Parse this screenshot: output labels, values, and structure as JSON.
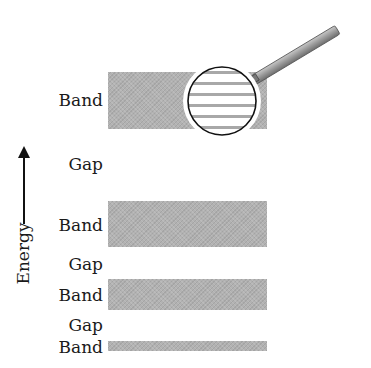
{
  "diagram": {
    "axis": {
      "label": "Energy",
      "direction": "up"
    },
    "levels": [
      {
        "type": "band",
        "label": "Band",
        "y_top": 72,
        "y_bottom": 129,
        "magnified": true
      },
      {
        "type": "gap",
        "label": "Gap"
      },
      {
        "type": "band",
        "label": "Band",
        "y_top": 201,
        "y_bottom": 247
      },
      {
        "type": "gap",
        "label": "Gap"
      },
      {
        "type": "band",
        "label": "Band",
        "y_top": 279,
        "y_bottom": 310
      },
      {
        "type": "gap",
        "label": "Gap"
      },
      {
        "type": "band",
        "label": "Band",
        "y_top": 341,
        "y_bottom": 351
      }
    ],
    "magnifier": {
      "shows": "discrete energy levels",
      "line_count": 6
    },
    "colors": {
      "band_fill": "#b2b2b2",
      "text": "#1a1a1a",
      "handle": "#999999"
    }
  }
}
